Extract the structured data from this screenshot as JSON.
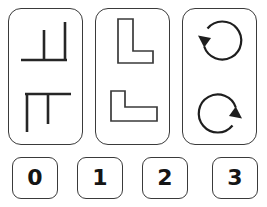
{
  "puzzle": {
    "type": "visual-rotation-analogy",
    "stroke_color": "#3a3a3a",
    "fill_color": "#ffffff",
    "text_color": "#151515",
    "background": "#ffffff",
    "panels": [
      {
        "index": 0,
        "name": "panel-thin-line-forks",
        "figures": [
          {
            "name": "thin-line-fork-upright",
            "description": "thin line figure: horizontal baseline with two upward vertical strokes, one at middle and one at right end",
            "orientation_degrees": 0
          },
          {
            "name": "thin-line-fork-inverted",
            "description": "same thin line figure rotated 180 degrees: horizontal line on top with two downward vertical strokes",
            "orientation_degrees": 180
          }
        ]
      },
      {
        "index": 1,
        "name": "panel-outlined-L-shapes",
        "figures": [
          {
            "name": "outlined-L-upright",
            "description": "hollow outlined L shape, tall vertical bar with foot extending right at the bottom",
            "orientation_degrees": 0
          },
          {
            "name": "outlined-L-rotated",
            "description": "same hollow outlined L rotated 90 degrees clockwise, short riser on the left with long horizontal base",
            "orientation_degrees": 90
          }
        ]
      },
      {
        "index": 2,
        "name": "panel-circular-arrows",
        "figures": [
          {
            "name": "circular-arrow-top-left",
            "description": "circular arrow loop with arrowhead at the upper left pointing downward",
            "orientation_degrees": 0
          },
          {
            "name": "circular-arrow-bottom-right",
            "description": "same circular arrow loop rotated 180 degrees, arrowhead at the lower right pointing upward",
            "orientation_degrees": 180
          }
        ]
      }
    ],
    "options": [
      {
        "index": 0,
        "label": "0"
      },
      {
        "index": 1,
        "label": "1"
      },
      {
        "index": 2,
        "label": "2"
      },
      {
        "index": 3,
        "label": "3"
      }
    ]
  }
}
